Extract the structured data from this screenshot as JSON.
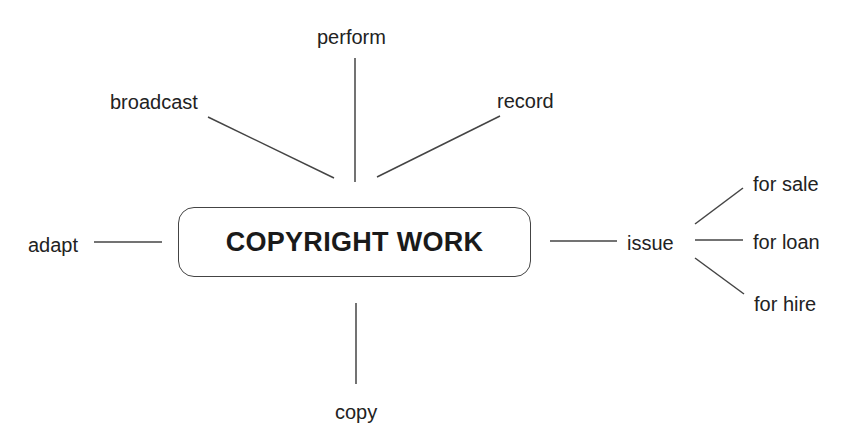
{
  "diagram": {
    "center": "COPYRIGHT WORK",
    "branches": {
      "perform": "perform",
      "broadcast": "broadcast",
      "record": "record",
      "adapt": "adapt",
      "issue": "issue",
      "copy": "copy"
    },
    "issue_subbranches": {
      "sale": "for sale",
      "loan": "for loan",
      "hire": "for hire"
    }
  }
}
